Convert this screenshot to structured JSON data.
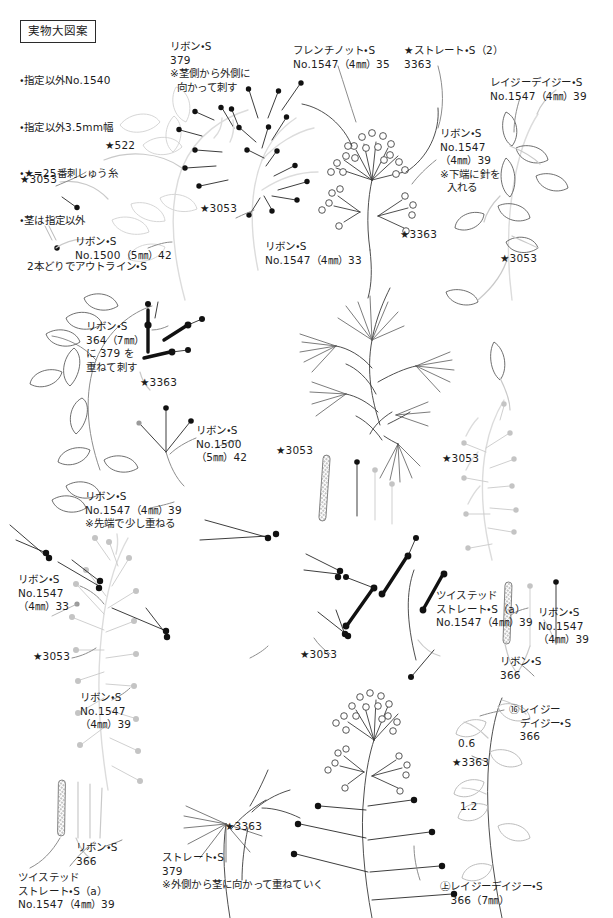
{
  "title": "実物大図案",
  "legend": {
    "lines": [
      "・指定以外No.1540",
      "・指定以外3.5mm幅",
      "・★=25番刺しゅう糸",
      "・茎は指定以外",
      "  2本どりでアウトライン・S"
    ]
  },
  "colors": {
    "ink": "#1d1d1d",
    "stem_dark": "#3a3a3a",
    "stem_mid": "#8d8d8d",
    "stem_light": "#c9c9c9",
    "stem_pale": "#dcdcdc",
    "dot_dark": "#111111",
    "dot_mid": "#9a9a9a",
    "dot_pale": "#c4c4c4",
    "knot_outline": "#3a3a3a",
    "border": "#2b2b2b"
  },
  "annotations": [
    {
      "id": "a01",
      "x": 170,
      "y": 40,
      "align": "left",
      "text": "リボン・S\n379\n※茎側から外側に\n  向かって刺す"
    },
    {
      "id": "a02",
      "x": 293,
      "y": 44,
      "align": "left",
      "text": "フレンチノット・S\nNo.1547（4㎜）35"
    },
    {
      "id": "a03",
      "x": 404,
      "y": 44,
      "align": "left",
      "text": "★ストレート・S（2）\n3363"
    },
    {
      "id": "a04",
      "x": 490,
      "y": 76,
      "align": "left",
      "text": "レイジーデイジー・S\nNo.1547（4㎜）39"
    },
    {
      "id": "a05",
      "x": 440,
      "y": 127,
      "align": "left",
      "text": "リボン・S\nNo.1547\n（4㎜）39\n※下端に針を\n  入れる"
    },
    {
      "id": "a06",
      "x": 105,
      "y": 139,
      "align": "left",
      "text": "★522"
    },
    {
      "id": "a07",
      "x": 20,
      "y": 173,
      "align": "left",
      "text": "★3053"
    },
    {
      "id": "a08",
      "x": 200,
      "y": 202,
      "align": "left",
      "text": "★3053"
    },
    {
      "id": "a09",
      "x": 75,
      "y": 235,
      "align": "left",
      "text": "リボン・S\nNo.1500（5㎜）42"
    },
    {
      "id": "a10",
      "x": 265,
      "y": 240,
      "align": "left",
      "text": "リボン・S\nNo.1547（4㎜）33"
    },
    {
      "id": "a11",
      "x": 500,
      "y": 252,
      "align": "left",
      "text": "★3053"
    },
    {
      "id": "a12",
      "x": 400,
      "y": 228,
      "align": "left",
      "text": "★3363"
    },
    {
      "id": "a13",
      "x": 86,
      "y": 320,
      "align": "left",
      "text": "リボン・S\n364（7㎜）\nに 379 を\n重ねて刺す"
    },
    {
      "id": "a14",
      "x": 140,
      "y": 376,
      "align": "left",
      "text": "★3363"
    },
    {
      "id": "a15",
      "x": 196,
      "y": 424,
      "align": "left",
      "text": "リボン・S\nNo.1500\n（5㎜）42"
    },
    {
      "id": "a16",
      "x": 276,
      "y": 444,
      "align": "left",
      "text": "★3053"
    },
    {
      "id": "a17",
      "x": 442,
      "y": 452,
      "align": "left",
      "text": "★3053"
    },
    {
      "id": "a18",
      "x": 85,
      "y": 490,
      "align": "left",
      "text": "リボン・S\nNo.1547（4㎜）39\n※先端で少し重ねる"
    },
    {
      "id": "a19",
      "x": 18,
      "y": 573,
      "align": "left",
      "text": "リボン・S\nNo.1547\n（4㎜）33"
    },
    {
      "id": "a20",
      "x": 33,
      "y": 650,
      "align": "left",
      "text": "★3053"
    },
    {
      "id": "a21",
      "x": 300,
      "y": 648,
      "align": "left",
      "text": "★3053"
    },
    {
      "id": "a22",
      "x": 436,
      "y": 589,
      "align": "left",
      "text": "ツイステッド\nストレート・S（a）\nNo.1547（4㎜）39"
    },
    {
      "id": "a23",
      "x": 538,
      "y": 606,
      "align": "left",
      "text": "リボン・S\nNo.1547\n（4㎜）39"
    },
    {
      "id": "a24",
      "x": 500,
      "y": 655,
      "align": "left",
      "text": "リボン・S\n366"
    },
    {
      "id": "a25",
      "x": 80,
      "y": 691,
      "align": "left",
      "text": "リボン・S\nNo.1547\n（4㎜）39"
    },
    {
      "id": "a26",
      "x": 509,
      "y": 703,
      "align": "left",
      "text": "⑯レイジー\n   デイジー・S\n   366",
      "circled": "小"
    },
    {
      "id": "a27",
      "x": 458,
      "y": 737,
      "align": "left",
      "text": "0.6"
    },
    {
      "id": "a28",
      "x": 452,
      "y": 756,
      "align": "left",
      "text": "★3363"
    },
    {
      "id": "a29",
      "x": 460,
      "y": 800,
      "align": "left",
      "text": "1.2"
    },
    {
      "id": "a30",
      "x": 225,
      "y": 820,
      "align": "left",
      "text": "★3363"
    },
    {
      "id": "a31",
      "x": 76,
      "y": 841,
      "align": "left",
      "text": "リボン・S\n366"
    },
    {
      "id": "a32",
      "x": 18,
      "y": 871,
      "align": "left",
      "text": "ツイステッド\nストレート・S（a）\nNo.1547（4㎜）39"
    },
    {
      "id": "a33",
      "x": 162,
      "y": 851,
      "align": "left",
      "text": "ストレート・S\n379\n※外側から茎に向かって重ねていく"
    },
    {
      "id": "a34",
      "x": 440,
      "y": 880,
      "align": "left",
      "text": "㊤レイジーデイジー・S\n   366（7㎜）",
      "circled": "大"
    }
  ],
  "figure": {
    "type": "embroidery-pattern-sheet"
  }
}
